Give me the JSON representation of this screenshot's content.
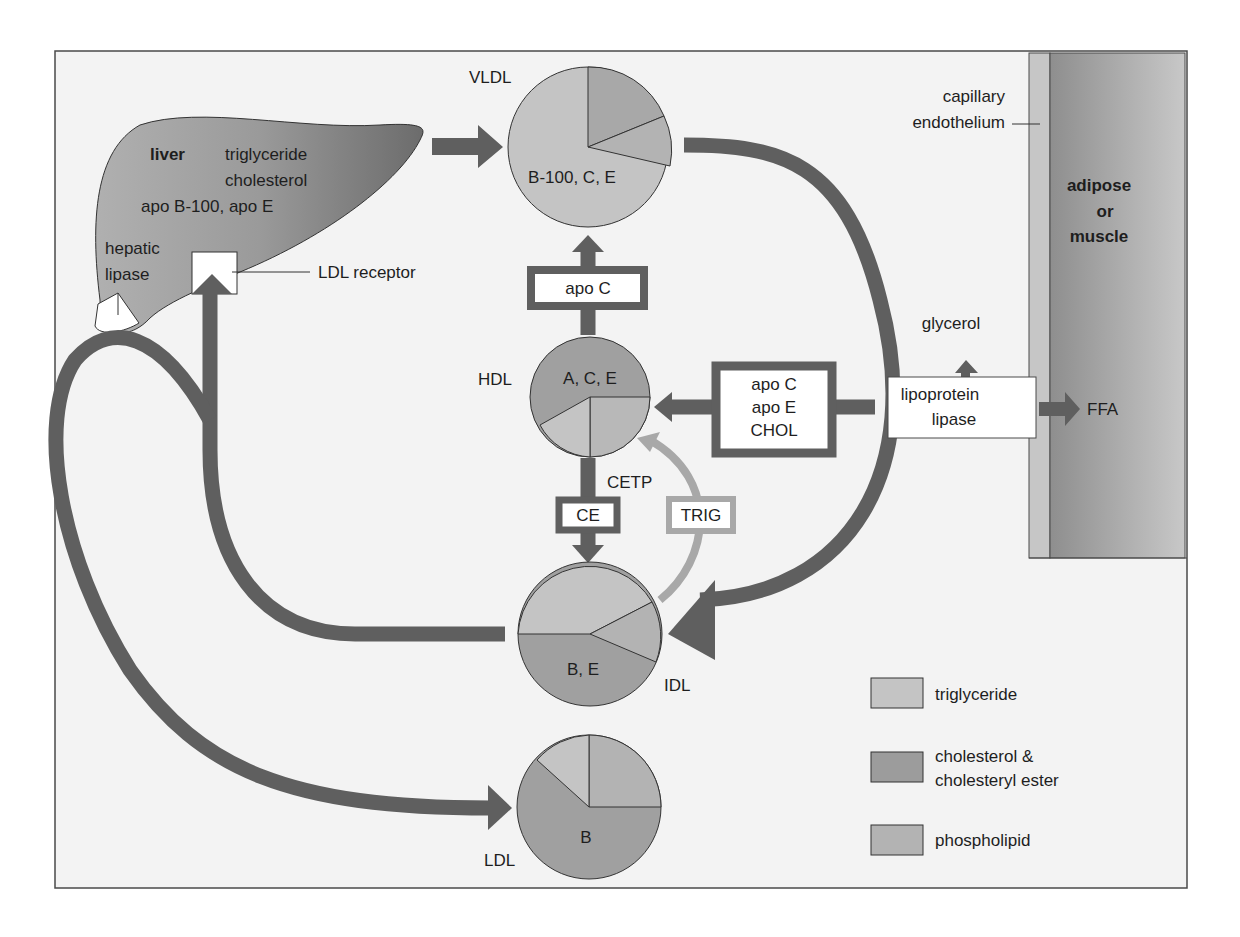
{
  "colors": {
    "background": "#f3f3f3",
    "frame": "#4a4a4a",
    "arrow_dark": "#5f5f5f",
    "arrow_light": "#a8a8a8",
    "triglyceride": "#c4c4c4",
    "cholesterol": "#9c9c9c",
    "phospholipid": "#b3b3b3",
    "tissue": "#a0a0a0",
    "endothelium": "#c6c6c6"
  },
  "liver": {
    "title": "liver",
    "contents": [
      "triglyceride",
      "cholesterol",
      "apo B-100, apo E"
    ],
    "hepatic_lipase": [
      "hepatic",
      "lipase"
    ],
    "ldl_receptor": "LDL receptor"
  },
  "particles": {
    "vldl": {
      "name": "VLDL",
      "apos": "B-100, C, E"
    },
    "hdl": {
      "name": "HDL",
      "apos": "A, C, E"
    },
    "idl": {
      "name": "IDL",
      "apos": "B, E"
    },
    "ldl": {
      "name": "LDL",
      "apos": "B"
    }
  },
  "transfers": {
    "apo_c": "apo C",
    "to_hdl": [
      "apo C",
      "apo E",
      "CHOL"
    ],
    "cetp": "CETP",
    "ce": "CE",
    "trig": "TRIG"
  },
  "tissue": {
    "endothelium": [
      "capillary",
      "endothelium"
    ],
    "tissue_label": [
      "adipose",
      "or",
      "muscle"
    ],
    "lipoprotein_lipase": [
      "lipoprotein",
      "lipase"
    ],
    "glycerol": "glycerol",
    "ffa": "FFA"
  },
  "legend": {
    "items": [
      {
        "key": "triglyceride",
        "lines": [
          "triglyceride"
        ]
      },
      {
        "key": "cholesterol",
        "lines": [
          "cholesterol &",
          "cholesteryl ester"
        ]
      },
      {
        "key": "phospholipid",
        "lines": [
          "phospholipid"
        ]
      }
    ]
  }
}
